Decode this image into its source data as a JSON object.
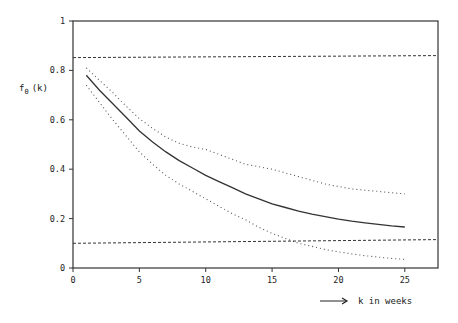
{
  "chart_data": {
    "type": "line",
    "title": "",
    "xlabel": "k in weeks",
    "ylabel": "f0 (k)",
    "ylabel_main": "f",
    "ylabel_sub": "0",
    "ylabel_arg": "(k)",
    "xlim": [
      0,
      27.5
    ],
    "ylim": [
      0,
      1
    ],
    "x_ticks": [
      0,
      5,
      10,
      15,
      20,
      25
    ],
    "y_ticks": [
      0,
      0.2,
      0.4,
      0.6,
      0.8,
      1
    ],
    "x_tick_labels": [
      "0",
      "5",
      "10",
      "15",
      "20",
      "25"
    ],
    "y_tick_labels": [
      "0",
      "0.2",
      "0.4",
      "0.6",
      "0.8",
      "1"
    ],
    "grid": false,
    "legend": null,
    "x": [
      1,
      2,
      3,
      4,
      5,
      6,
      7,
      8,
      9,
      10,
      11,
      12,
      13,
      14,
      15,
      16,
      17,
      18,
      19,
      20,
      21,
      22,
      23,
      24,
      25
    ],
    "series": [
      {
        "name": "estimate",
        "style": "solid",
        "values": [
          0.78,
          0.72,
          0.665,
          0.61,
          0.555,
          0.51,
          0.47,
          0.435,
          0.405,
          0.375,
          0.35,
          0.325,
          0.3,
          0.28,
          0.26,
          0.245,
          0.23,
          0.218,
          0.208,
          0.198,
          0.19,
          0.183,
          0.177,
          0.171,
          0.166
        ]
      },
      {
        "name": "upper confidence bound",
        "style": "dotted",
        "values": [
          0.81,
          0.76,
          0.71,
          0.655,
          0.605,
          0.565,
          0.53,
          0.505,
          0.49,
          0.48,
          0.46,
          0.44,
          0.42,
          0.41,
          0.4,
          0.385,
          0.37,
          0.355,
          0.34,
          0.33,
          0.32,
          0.315,
          0.31,
          0.305,
          0.3
        ]
      },
      {
        "name": "lower confidence bound",
        "style": "dotted",
        "values": [
          0.74,
          0.67,
          0.6,
          0.535,
          0.47,
          0.42,
          0.375,
          0.34,
          0.31,
          0.28,
          0.25,
          0.22,
          0.195,
          0.165,
          0.14,
          0.12,
          0.1,
          0.088,
          0.075,
          0.065,
          0.057,
          0.05,
          0.044,
          0.039,
          0.035
        ]
      },
      {
        "name": "upper limit",
        "style": "dashed",
        "x": [
          0,
          27.5
        ],
        "values": [
          0.852,
          0.86
        ]
      },
      {
        "name": "lower limit",
        "style": "dashed",
        "x": [
          0,
          27.5
        ],
        "values": [
          0.1,
          0.115
        ]
      }
    ]
  }
}
